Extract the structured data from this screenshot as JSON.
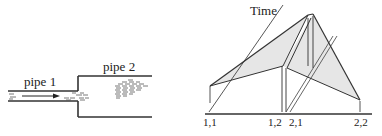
{
  "left_diagram": {
    "pipe1_label": "pipe 1",
    "pipe2_label": "pipe 2"
  },
  "right_diagram": {
    "axis_label": "Time",
    "tick_labels": [
      "1,1",
      "1,2",
      "2,1",
      "2,2"
    ]
  },
  "colors": {
    "line": "#333333",
    "fill": "#e8e8e8"
  }
}
